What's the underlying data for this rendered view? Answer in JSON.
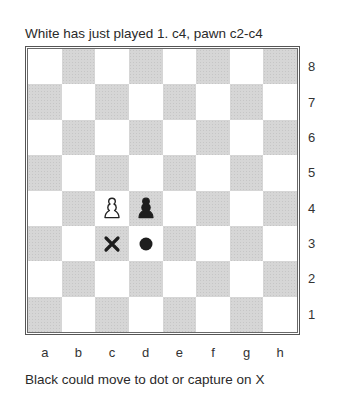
{
  "caption_top": "White has just played 1. c4, pawn c2-c4",
  "caption_bottom": "Black could move to dot or capture on X",
  "board": {
    "files": [
      "a",
      "b",
      "c",
      "d",
      "e",
      "f",
      "g",
      "h"
    ],
    "ranks": [
      "8",
      "7",
      "6",
      "5",
      "4",
      "3",
      "2",
      "1"
    ],
    "orientation": "white-bottom",
    "light_square_color": "#ffffff",
    "dark_square_color": "#d6d6d6",
    "border_color": "#555555",
    "pieces": [
      {
        "square": "c4",
        "color": "white",
        "type": "pawn",
        "icon": "white-pawn-icon"
      },
      {
        "square": "d4",
        "color": "black",
        "type": "pawn",
        "icon": "black-pawn-icon"
      }
    ],
    "markers": [
      {
        "square": "c3",
        "type": "cross",
        "meaning": "capture",
        "icon": "cross-icon"
      },
      {
        "square": "d3",
        "type": "dot",
        "meaning": "move",
        "icon": "dot-icon"
      }
    ]
  }
}
